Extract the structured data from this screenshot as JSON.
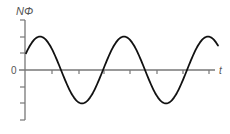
{
  "chart_data": {
    "type": "line",
    "title": "",
    "xlabel": "t",
    "ylabel": "NΦ",
    "origin_label": "0",
    "ylim": [
      -3,
      3
    ],
    "y_ticks": [
      -3,
      -2,
      -1,
      0,
      1,
      2,
      3
    ],
    "x_ticks_count": 7,
    "grid": false,
    "legend": null,
    "series": [
      {
        "name": "NΦ(t)",
        "function": "A*sin(2*pi*t/T + pi/6)",
        "amplitude": 2,
        "period_ticks": 3.2,
        "phase_rad": 0.5236,
        "x": [
          0,
          0.5,
          1.0,
          1.35,
          1.5,
          2.0,
          2.15,
          2.5,
          3.0,
          3.5,
          3.7,
          4.0,
          4.5,
          4.8,
          5.0,
          5.5,
          6.0,
          6.5,
          7.0
        ],
        "values": [
          1.0,
          1.9,
          1.85,
          1.0,
          0.6,
          -0.9,
          -1.2,
          -1.9,
          -1.7,
          -0.4,
          0.0,
          0.9,
          1.9,
          2.0,
          1.8,
          0.8,
          -0.6,
          -1.8,
          -1.9
        ]
      }
    ],
    "color": "#111111",
    "axis_color": "#666666"
  }
}
